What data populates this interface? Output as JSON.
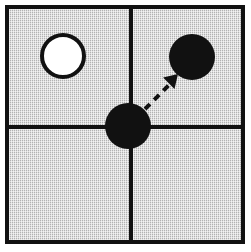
{
  "figure": {
    "canvas": {
      "width": 251,
      "height": 252
    },
    "background_color": "#ffffff"
  },
  "frame": {
    "name": "outer-border",
    "x": 5,
    "y": 5,
    "width": 240,
    "height": 239,
    "border_color": "#111111",
    "border_width": 4,
    "fill_color": "#c6c6c6",
    "fill_style": "dithered-gray-halftone"
  },
  "grid": {
    "type": "2x2",
    "line_color": "#111111",
    "line_width": 4,
    "vertical_line": {
      "x": 131,
      "y1": 7,
      "y2": 242
    },
    "horizontal_line": {
      "y": 127,
      "x1": 7,
      "x2": 243
    },
    "quadrants": [
      {
        "id": "top-left",
        "label": ""
      },
      {
        "id": "top-right",
        "label": ""
      },
      {
        "id": "bottom-left",
        "label": ""
      },
      {
        "id": "bottom-right",
        "label": ""
      }
    ]
  },
  "shapes": [
    {
      "id": "white-circle",
      "kind": "circle",
      "quadrant": "top-left",
      "cx": 63,
      "cy": 56,
      "r": 21,
      "fill": "#ffffff",
      "stroke": "#111111",
      "stroke_width": 4
    },
    {
      "id": "center-black-circle",
      "kind": "circle",
      "quadrant": "center-intersection",
      "cx": 128,
      "cy": 126,
      "r": 23,
      "fill": "#111111",
      "stroke": "none",
      "stroke_width": 0
    },
    {
      "id": "target-black-circle",
      "kind": "circle",
      "quadrant": "top-right",
      "cx": 192,
      "cy": 57,
      "r": 23,
      "fill": "#111111",
      "stroke": "none",
      "stroke_width": 0
    }
  ],
  "arrow": {
    "id": "movement-arrow",
    "style": "dashed",
    "color": "#111111",
    "line_width": 4,
    "dash_pattern": "7 6",
    "from": {
      "x": 145,
      "y": 109
    },
    "to": {
      "x": 174,
      "y": 80
    },
    "head": {
      "kind": "filled-triangle",
      "tip_x": 178,
      "tip_y": 74,
      "size": 13,
      "angle_deg": -45
    },
    "direction": "up-right",
    "meaning": "center circle moves to top-right quadrant"
  }
}
